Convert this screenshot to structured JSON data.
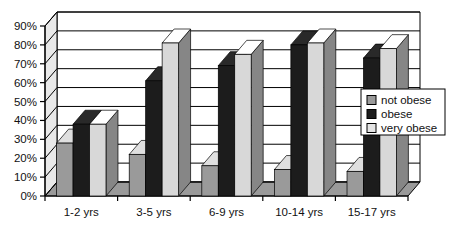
{
  "chart_data": {
    "type": "bar",
    "title": "",
    "subtitle": "",
    "xlabel": "",
    "ylabel": "",
    "categories": [
      "1-2 yrs",
      "3-5 yrs",
      "6-9 yrs",
      "10-14 yrs",
      "15-17 yrs"
    ],
    "series": [
      {
        "name": "not obese",
        "color": "#9a9a9a",
        "values": [
          28,
          22,
          16,
          14,
          13
        ]
      },
      {
        "name": "obese",
        "color": "#1c1c1c",
        "values": [
          38,
          61,
          69,
          80,
          73
        ]
      },
      {
        "name": "very obese",
        "color": "#d8d8d8",
        "values": [
          38,
          81,
          75,
          81,
          78
        ]
      }
    ],
    "ylim": [
      0,
      90
    ],
    "ytick_values": [
      0,
      10,
      20,
      30,
      40,
      50,
      60,
      70,
      80,
      90
    ],
    "ytick_labels": [
      "0%",
      "10%",
      "20%",
      "30%",
      "40%",
      "50%",
      "60%",
      "70%",
      "80%",
      "90%"
    ],
    "grid": true,
    "grid_axis": "y",
    "legend_position": "right",
    "three_d": true
  },
  "legend": {
    "entries": [
      {
        "label": "not obese",
        "swatch_color": "#9a9a9a"
      },
      {
        "label": "obese",
        "swatch_color": "#1c1c1c"
      },
      {
        "label": "very obese",
        "swatch_color": "#e4e4e4"
      }
    ]
  },
  "yaxis": {
    "labels": [
      "90%",
      "80%",
      "70%",
      "60%",
      "50%",
      "40%",
      "30%",
      "20%",
      "10%",
      "0%"
    ]
  },
  "xaxis": {
    "labels": [
      "1-2 yrs",
      "3-5 yrs",
      "6-9 yrs",
      "10-14 yrs",
      "15-17 yrs"
    ]
  }
}
